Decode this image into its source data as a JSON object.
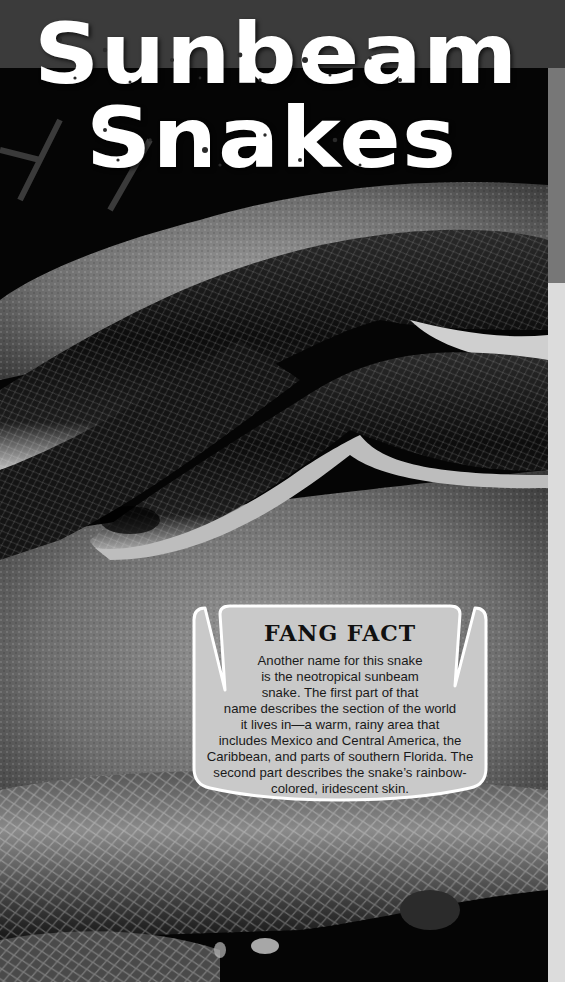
{
  "page": {
    "title_line1": "Sunbeam",
    "title_line2": "Snakes",
    "colors": {
      "top_band": "#3b3b3b",
      "edge_dark": "#777777",
      "edge_light": "#dcdcdc",
      "callout_fill": "#c9c9c9",
      "callout_border": "#ffffff"
    }
  },
  "photo": {
    "subject": "snake-photo",
    "description": "Black-and-white photo of a glossy sunbeam snake coiled on rock"
  },
  "fang_fact": {
    "heading": "FANG FACT",
    "lines": [
      "Another name for this snake",
      "is the neotropical sunbeam",
      "snake. The first part of that",
      "name describes the section of the world",
      "it lives in—a warm, rainy area that",
      "includes Mexico and Central America, the",
      "Caribbean, and parts of southern Florida. The",
      "second part describes the snake’s rainbow-",
      "colored, iridescent skin."
    ]
  }
}
